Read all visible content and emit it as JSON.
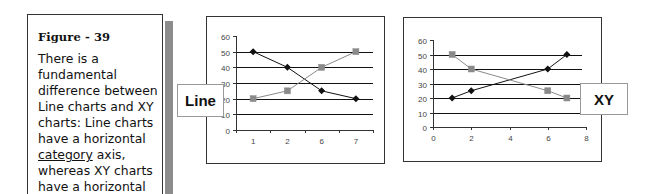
{
  "note": {
    "title": "Figure - 39",
    "lines": [
      {
        "text": "There is a"
      },
      {
        "text": "fundamental"
      },
      {
        "text": "difference between"
      },
      {
        "text": "Line charts and XY"
      },
      {
        "text": "charts: Line charts"
      },
      {
        "text": "have a horizontal"
      },
      {
        "pre": "",
        "underlined": "category",
        "post": " axis,"
      },
      {
        "text": "whereas XY charts"
      },
      {
        "text": "have a horizontal"
      }
    ]
  },
  "colors": {
    "series_dark": "#111111",
    "series_gray": "#8a8a8a",
    "series_gray_marker": "#7a7a7a"
  },
  "chart_data": [
    {
      "type": "line",
      "label": "Line",
      "title": "",
      "xlabel": "",
      "ylabel": "",
      "categories": [
        "1",
        "2",
        "6",
        "7"
      ],
      "ylim": [
        0,
        60
      ],
      "yticks": [
        0,
        10,
        20,
        30,
        40,
        50,
        60
      ],
      "grid": true,
      "legend": "none",
      "series": [
        {
          "name": "diamond series",
          "marker": "diamond",
          "color": "#111111",
          "values": [
            50,
            40,
            25,
            20
          ]
        },
        {
          "name": "square series",
          "marker": "square",
          "color": "#8a8a8a",
          "values": [
            20,
            25,
            40,
            50
          ]
        }
      ]
    },
    {
      "type": "scatter",
      "label": "XY",
      "title": "",
      "xlabel": "",
      "ylabel": "",
      "xlim": [
        0,
        8
      ],
      "xticks": [
        0,
        2,
        4,
        6,
        8
      ],
      "ylim": [
        0,
        60
      ],
      "yticks": [
        0,
        10,
        20,
        30,
        40,
        50,
        60
      ],
      "grid": true,
      "legend": "none",
      "series": [
        {
          "name": "diamond series",
          "marker": "diamond",
          "color": "#111111",
          "x": [
            1,
            2,
            6,
            7
          ],
          "y": [
            20,
            25,
            40,
            50
          ]
        },
        {
          "name": "square series",
          "marker": "square",
          "color": "#8a8a8a",
          "x": [
            1,
            2,
            6,
            7
          ],
          "y": [
            50,
            40,
            25,
            20
          ]
        }
      ]
    }
  ]
}
